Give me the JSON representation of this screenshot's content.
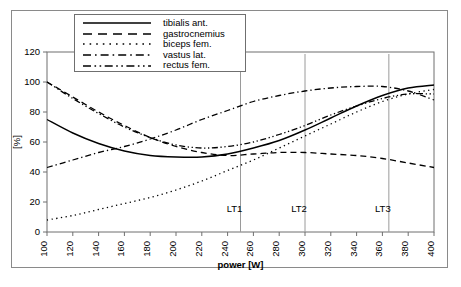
{
  "chart_data": {
    "type": "line",
    "title": "",
    "xlabel": "power [W]",
    "ylabel": "[%]",
    "xlim": [
      100,
      400
    ],
    "ylim": [
      0,
      120
    ],
    "xticks": [
      100,
      120,
      140,
      160,
      180,
      200,
      220,
      240,
      260,
      280,
      300,
      320,
      340,
      360,
      380,
      400
    ],
    "yticks": [
      0,
      20,
      40,
      60,
      80,
      100,
      120
    ],
    "grid": false,
    "legend_position": "top-left-inside",
    "x": [
      100,
      120,
      140,
      160,
      180,
      200,
      220,
      240,
      260,
      280,
      300,
      320,
      340,
      360,
      380,
      400
    ],
    "series": [
      {
        "name": "tibialis ant.",
        "style": "solid",
        "values": [
          75,
          66,
          59,
          54,
          51,
          50,
          50,
          52,
          56,
          61,
          68,
          76,
          84,
          91,
          96,
          98
        ]
      },
      {
        "name": "gastrocnemius",
        "style": "dashed",
        "values": [
          100,
          90,
          80,
          71,
          63,
          57,
          53,
          51,
          52,
          53,
          53,
          52,
          51,
          49,
          46,
          43
        ]
      },
      {
        "name": "biceps fem.",
        "style": "dotted",
        "values": [
          8,
          11,
          15,
          19,
          23,
          28,
          34,
          41,
          48,
          56,
          64,
          72,
          80,
          87,
          92,
          95
        ]
      },
      {
        "name": "vastus lat.",
        "style": "dashdot",
        "values": [
          43,
          48,
          53,
          57,
          62,
          68,
          75,
          81,
          87,
          91,
          94,
          96,
          97,
          97,
          94,
          88
        ]
      },
      {
        "name": "rectus fem.",
        "style": "dashdotdot",
        "values": [
          100,
          89,
          79,
          70,
          63,
          58,
          56,
          57,
          60,
          65,
          71,
          78,
          84,
          89,
          92,
          92
        ]
      }
    ],
    "markers": [
      {
        "label": "LT1",
        "x": 250
      },
      {
        "label": "LT2",
        "x": 300
      },
      {
        "label": "LT3",
        "x": 365
      }
    ]
  }
}
